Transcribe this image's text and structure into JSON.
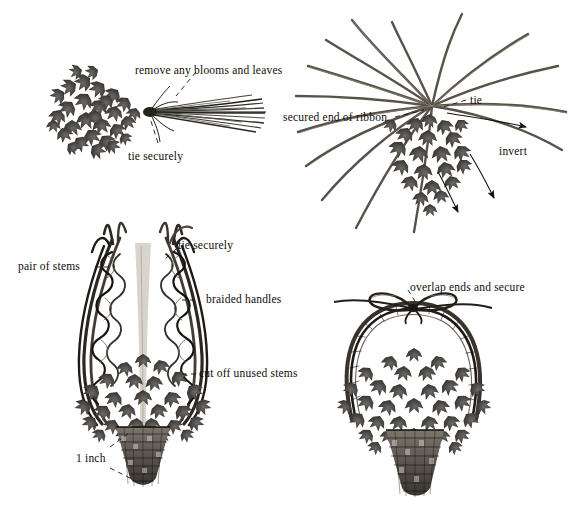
{
  "figure": {
    "type": "instructional-illustration",
    "style": "grayscale engraving",
    "background_color": "#ffffff",
    "ink_color": "#14100e",
    "panel_count": 4
  },
  "panels": [
    {
      "id": "step-1-bundle",
      "name": "bundled-stems",
      "labels": [
        {
          "name": "remove-blooms-label",
          "text": "remove any blooms and leaves",
          "x": 135,
          "y": 64,
          "size": 11.5
        },
        {
          "name": "tie-securely-label",
          "text": "tie securely",
          "x": 128,
          "y": 150,
          "size": 11.5
        }
      ]
    },
    {
      "id": "step-2-invert",
      "name": "radiating-stems",
      "labels": [
        {
          "name": "secured-end-label",
          "text": "secured end of ribbon",
          "x": 283,
          "y": 111,
          "size": 11.5
        },
        {
          "name": "tie-label",
          "text": "tie",
          "x": 470,
          "y": 94,
          "size": 11.5
        },
        {
          "name": "invert-label",
          "text": "invert",
          "x": 499,
          "y": 145,
          "size": 11.5
        }
      ]
    },
    {
      "id": "step-3-braided",
      "name": "braided-handles-basket",
      "labels": [
        {
          "name": "pair-of-stems-label",
          "text": "pair of stems",
          "x": 18,
          "y": 260,
          "size": 11.5
        },
        {
          "name": "tie-securely-handles-label",
          "text": "tie securely",
          "x": 178,
          "y": 239,
          "size": 11.5
        },
        {
          "name": "braided-handles-label",
          "text": "braided handles",
          "x": 206,
          "y": 293,
          "size": 11.5
        },
        {
          "name": "cut-off-stems-label",
          "text": "cut off unused stems",
          "x": 199,
          "y": 367,
          "size": 11.5
        },
        {
          "name": "one-inch-label",
          "text": "1 inch",
          "x": 76,
          "y": 452,
          "size": 11.5
        }
      ]
    },
    {
      "id": "step-4-finished",
      "name": "finished-basket",
      "labels": [
        {
          "name": "overlap-ends-label",
          "text": "overlap ends and secure",
          "x": 410,
          "y": 281,
          "size": 11.5
        }
      ]
    }
  ]
}
